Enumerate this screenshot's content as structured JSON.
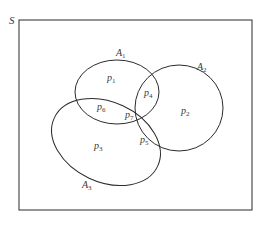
{
  "diagram": {
    "type": "venn",
    "universe_label": "S",
    "sets": [
      {
        "name": "A",
        "sub": "1"
      },
      {
        "name": "A",
        "sub": "2"
      },
      {
        "name": "A",
        "sub": "3"
      }
    ],
    "regions": [
      {
        "name": "p",
        "sub": "1",
        "desc": "A1 only"
      },
      {
        "name": "p",
        "sub": "2",
        "desc": "A2 only"
      },
      {
        "name": "p",
        "sub": "3",
        "desc": "A3 only"
      },
      {
        "name": "p",
        "sub": "4",
        "desc": "A1 and A2 only"
      },
      {
        "name": "p",
        "sub": "5",
        "desc": "A2 and A3 only"
      },
      {
        "name": "p",
        "sub": "6",
        "desc": "A1 and A3 only"
      },
      {
        "name": "p",
        "sub": "7",
        "desc": "A1 and A2 and A3"
      }
    ],
    "colors": {
      "stroke": "#2b2b2b",
      "text": "#3a3a3a",
      "background": "#ffffff"
    }
  }
}
